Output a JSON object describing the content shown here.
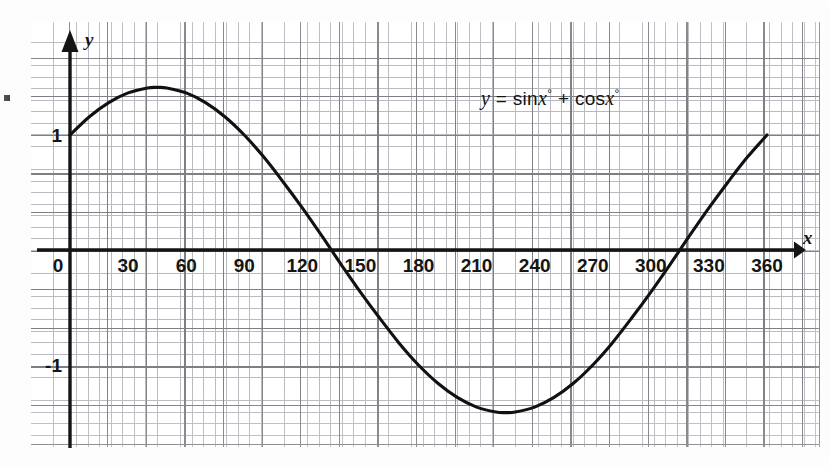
{
  "figure": {
    "equation_text": "y = sinx° + cosx°",
    "equation_parts": {
      "lhs": "y",
      "eq": "=",
      "term1": "sin",
      "var1": "x",
      "deg1": "°",
      "plus": "+",
      "term2": "cos",
      "var2": "x",
      "deg2": "°"
    },
    "x_axis_label": "x",
    "y_axis_label": "y",
    "background": "graph-paper"
  },
  "chart_data": {
    "type": "line",
    "title": "",
    "annotation": "y = sinx° + cosx°",
    "xlabel": "x",
    "ylabel": "y",
    "xlim": [
      -10,
      375
    ],
    "ylim": [
      -1.95,
      1.98
    ],
    "grid": true,
    "legend": null,
    "x_ticks": [
      0,
      30,
      60,
      90,
      120,
      150,
      180,
      210,
      240,
      270,
      300,
      330,
      360
    ],
    "x_tick_labels": [
      "0",
      "30",
      "60",
      "90",
      "120",
      "150",
      "180",
      "210",
      "240",
      "270",
      "300",
      "330",
      "360"
    ],
    "y_ticks": [
      -1,
      1
    ],
    "y_tick_labels": [
      "-1",
      "1"
    ],
    "series": [
      {
        "name": "y = sinx° + cosx°",
        "color": "#111111",
        "x": [
          0,
          10,
          20,
          30,
          40,
          45,
          50,
          60,
          70,
          80,
          90,
          100,
          110,
          120,
          130,
          135,
          140,
          150,
          160,
          170,
          180,
          190,
          200,
          210,
          220,
          225,
          230,
          240,
          250,
          260,
          270,
          280,
          290,
          300,
          310,
          315,
          320,
          330,
          340,
          350,
          360
        ],
        "y": [
          1.0,
          1.159,
          1.282,
          1.366,
          1.409,
          1.414,
          1.409,
          1.366,
          1.282,
          1.159,
          1.0,
          0.81,
          0.594,
          0.366,
          0.124,
          0.0,
          -0.124,
          -0.366,
          -0.594,
          -0.81,
          -1.0,
          -1.159,
          -1.282,
          -1.366,
          -1.409,
          -1.414,
          -1.409,
          -1.366,
          -1.282,
          -1.159,
          -1.0,
          -0.81,
          -0.594,
          -0.366,
          -0.124,
          0.0,
          0.124,
          0.366,
          0.594,
          0.81,
          1.0
        ]
      }
    ],
    "key_points": {
      "y_intercept": 1.0,
      "maximum": {
        "x": 45,
        "y": 1.414
      },
      "minimum": {
        "x": 225,
        "y": -1.414
      },
      "zeros": [
        135,
        315
      ],
      "amplitude": 1.414,
      "period": 360
    }
  }
}
